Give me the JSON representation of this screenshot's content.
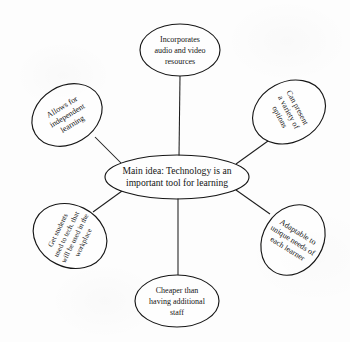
{
  "diagram": {
    "type": "spider-web-concept-map",
    "background_color": "#fdfdfd",
    "line_color": "#1d1d1d",
    "text_color": "#141414",
    "central_node": {
      "id": "central-node",
      "lines": [
        "Main idea: Technology is an",
        "important tool for learning"
      ],
      "text": "Main idea: Technology is an important tool for learning",
      "cx": 177,
      "cy": 177,
      "rx": 72,
      "ry": 22,
      "rotation": 0
    },
    "branches": [
      {
        "id": "incorporates-media",
        "name": "branch-incorporates-media",
        "lines": [
          "Incorporates",
          "audio and video",
          "resources"
        ],
        "text": "Incorporates audio and video resources",
        "cx": 180,
        "cy": 50,
        "rx": 40,
        "ry": 26,
        "rotation": 0,
        "line_height": 10.6,
        "edge": {
          "x1": 180,
          "y1": 76,
          "x2": 179,
          "y2": 156
        }
      },
      {
        "id": "can-present-variety",
        "name": "branch-can-present-variety",
        "lines": [
          "Can present",
          "a variety of",
          "options"
        ],
        "text": "Can present a variety of options",
        "cx": 289,
        "cy": 112,
        "rx": 30,
        "ry": 38,
        "rotation": 62,
        "line_height": 10.0,
        "edge": {
          "x1": 268,
          "y1": 141,
          "x2": 236,
          "y2": 164
        }
      },
      {
        "id": "adaptable-unique-needs",
        "name": "branch-adaptable-unique-needs",
        "lines": [
          "Adaptable to",
          "unique needs of",
          "each learner"
        ],
        "text": "Adaptable to unique needs of each learner",
        "cx": 293,
        "cy": 240,
        "rx": 30,
        "ry": 37,
        "rotation": 32,
        "line_height": 9.8,
        "edge": {
          "x1": 270,
          "y1": 214,
          "x2": 236,
          "y2": 190
        }
      },
      {
        "id": "cheaper-than-staff",
        "name": "branch-cheaper-than-staff",
        "lines": [
          "Cheaper than",
          "having additional",
          "staff"
        ],
        "text": "Cheaper than having additional staff",
        "cx": 177,
        "cy": 301,
        "rx": 42,
        "ry": 26,
        "rotation": 0,
        "line_height": 10.6,
        "edge": {
          "x1": 178,
          "y1": 198,
          "x2": 178,
          "y2": 275
        }
      },
      {
        "id": "get-students-used-to-tech",
        "name": "branch-get-students-used-to-tech",
        "lines": [
          "Get students",
          "used to tech. that",
          "will be used in the",
          "workplace"
        ],
        "text": "Get students used to tech. that will be used in the workplace",
        "cx": 70,
        "cy": 236,
        "rx": 31,
        "ry": 38,
        "rotation": -64,
        "line_height": 9.4,
        "edge": {
          "x1": 93,
          "y1": 212,
          "x2": 122,
          "y2": 191
        }
      },
      {
        "id": "allows-independent-learning",
        "name": "branch-allows-independent-learning",
        "lines": [
          "Allows for",
          "independent",
          "learning"
        ],
        "text": "Allows for independent learning",
        "cx": 67,
        "cy": 115,
        "rx": 37,
        "ry": 29,
        "rotation": -31,
        "line_height": 10.0,
        "edge": {
          "x1": 95,
          "y1": 137,
          "x2": 121,
          "y2": 163
        }
      }
    ]
  }
}
